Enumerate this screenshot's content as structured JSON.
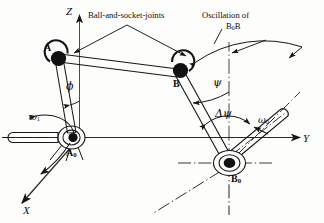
{
  "figure": {
    "type": "mechanism-diagram",
    "background_color": "#fdfdfc",
    "line_color": "#161616"
  },
  "axes": {
    "z": {
      "label": "Z",
      "direction": "up"
    },
    "y": {
      "label": "Y",
      "direction": "right"
    },
    "x": {
      "label": "X",
      "direction": "down-left"
    }
  },
  "annotations": {
    "ball_joints": {
      "text": "Ball-and-socket-joints"
    },
    "oscillation": {
      "line1": "Oscillation of",
      "line2_base": "B",
      "line2_sub": "0",
      "line2_tail": "B"
    }
  },
  "points": {
    "a": {
      "label": "A"
    },
    "b": {
      "label": "B"
    },
    "a0": {
      "label_base": "A",
      "label_sub": "0"
    },
    "b0": {
      "label_base": "B",
      "label_sub": "0"
    }
  },
  "angles": {
    "phi": {
      "symbol": "ϕ"
    },
    "psi": {
      "symbol": "ψ"
    },
    "delta_psi": {
      "symbol": "Δψ"
    }
  },
  "velocities": {
    "omega1": {
      "base": "ω",
      "sub": "1"
    },
    "omega0": {
      "base": "ω",
      "sub": "0"
    }
  }
}
